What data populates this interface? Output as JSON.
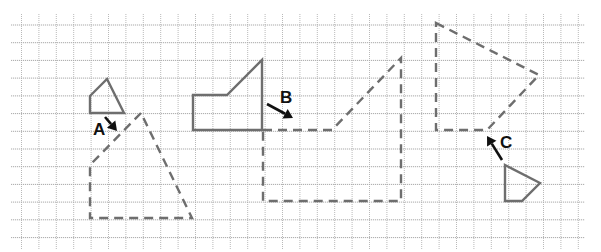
{
  "diagram": {
    "colors": {
      "background": "#ffffff",
      "grid": "#b0b0b0",
      "shape_stroke": "#6e6e6e",
      "label": "#111111"
    },
    "grid": {
      "x_start": 21.5,
      "y_start": 25,
      "spacing": 17.4,
      "columns": 33,
      "rows": 13
    },
    "shapes": [
      {
        "id": "A",
        "label": "A",
        "original": [
          [
            90,
            96
          ],
          [
            107,
            79
          ],
          [
            124,
            113
          ],
          [
            90,
            113
          ]
        ],
        "image": [
          [
            141,
            113
          ],
          [
            90,
            165
          ],
          [
            90,
            218
          ],
          [
            192,
            218
          ]
        ],
        "label_pos": [
          93,
          135
        ],
        "arrow": [
          [
            105,
            117
          ],
          [
            117,
            131
          ]
        ]
      },
      {
        "id": "B",
        "label": "B",
        "original": [
          [
            193,
            95
          ],
          [
            227,
            95
          ],
          [
            262,
            60
          ],
          [
            262,
            130
          ],
          [
            193,
            130
          ]
        ],
        "image": [
          [
            263,
            130
          ],
          [
            332,
            130
          ],
          [
            401,
            58
          ],
          [
            401,
            201
          ],
          [
            263,
            201
          ]
        ],
        "label_pos": [
          280,
          103
        ],
        "arrow": [
          [
            267,
            104
          ],
          [
            293,
            118
          ]
        ]
      },
      {
        "id": "C",
        "label": "C",
        "original": [
          [
            505,
            165
          ],
          [
            540,
            183
          ],
          [
            522,
            201
          ],
          [
            505,
            201
          ]
        ],
        "image": [
          [
            436,
            23
          ],
          [
            539,
            75
          ],
          [
            487,
            130
          ],
          [
            436,
            130
          ]
        ],
        "label_pos": [
          500,
          148
        ],
        "arrow": [
          [
            502,
            160
          ],
          [
            487,
            136
          ]
        ]
      }
    ]
  }
}
